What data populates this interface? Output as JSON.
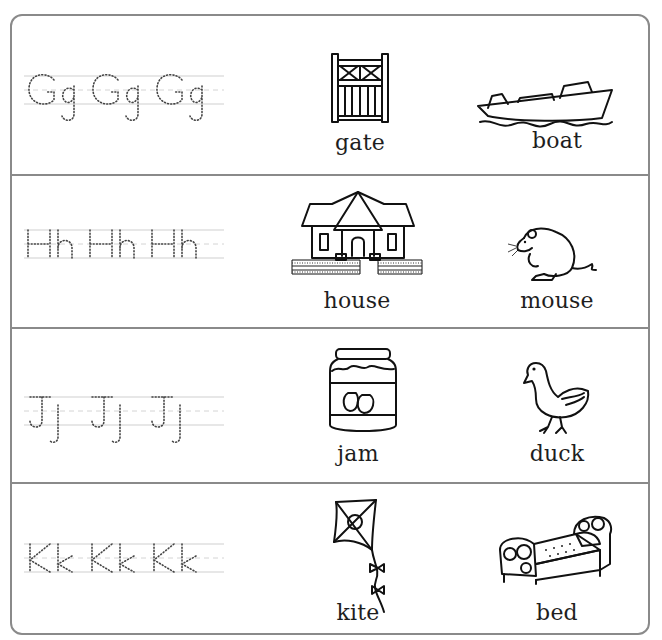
{
  "worksheet": {
    "rows": [
      {
        "letter_pair": "Gg",
        "trace_text": "Gg Gg Gg",
        "pictures": [
          {
            "word": "gate",
            "icon": "gate-icon"
          },
          {
            "word": "boat",
            "icon": "boat-icon"
          }
        ]
      },
      {
        "letter_pair": "Hh",
        "trace_text": "Hh Hh Hh",
        "pictures": [
          {
            "word": "house",
            "icon": "house-icon"
          },
          {
            "word": "mouse",
            "icon": "mouse-icon"
          }
        ]
      },
      {
        "letter_pair": "Jj",
        "trace_text": "Jj Jj Jj",
        "pictures": [
          {
            "word": "jam",
            "icon": "jam-jar-icon"
          },
          {
            "word": "duck",
            "icon": "duck-icon"
          }
        ]
      },
      {
        "letter_pair": "Kk",
        "trace_text": "Kk Kk Kk",
        "pictures": [
          {
            "word": "kite",
            "icon": "kite-icon"
          },
          {
            "word": "bed",
            "icon": "bed-icon"
          }
        ]
      }
    ]
  },
  "colors": {
    "border": "#8a8a8a",
    "text": "#1e1e1e",
    "guide_lines": "#cfcfcf",
    "dotted_letters": "#444444"
  }
}
